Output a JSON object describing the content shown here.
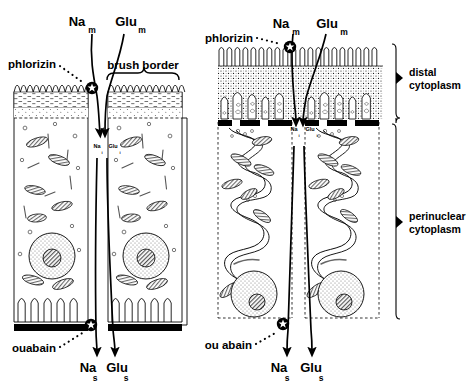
{
  "figure": {
    "background_color": "#ffffff",
    "ink_color": "#000000"
  },
  "panels": {
    "left": {
      "name": "schematic-diagram-panel",
      "apical_labels": {
        "sodium": "Na",
        "sodium_sub": "m",
        "glucose": "Glu",
        "glucose_sub": "m"
      },
      "inhibitor_apical": "phlorizin",
      "brush_border_label": "brush border",
      "intracellular_labels": {
        "sodium": "Na",
        "sodium_sub": "i",
        "glucose": "Glu",
        "glucose_sub": "i"
      },
      "inhibitor_basal": "ouabain",
      "basal_labels": {
        "sodium": "Na",
        "sodium_sub": "s",
        "glucose": "Glu",
        "glucose_sub": "s"
      }
    },
    "right": {
      "name": "realistic-morphology-panel",
      "apical_labels": {
        "sodium": "Na",
        "sodium_sub": "m",
        "glucose": "Glu",
        "glucose_sub": "m"
      },
      "inhibitor_apical": "phlorizin",
      "intracellular_labels": {
        "sodium": "Na",
        "sodium_sub": "i",
        "glucose": "Glu",
        "glucose_sub": "i"
      },
      "inhibitor_basal": "ou abain",
      "basal_labels": {
        "sodium": "Na",
        "sodium_sub": "s",
        "glucose": "Glu",
        "glucose_sub": "s"
      }
    }
  },
  "region_brackets": [
    {
      "id": "distal",
      "line1": "distal",
      "line2": "cytoplasm"
    },
    {
      "id": "perinuclear",
      "line1": "perinuclear",
      "line2": "cytoplasm"
    }
  ],
  "symbols": {
    "inhibition_marker": "starburst-inhibition-icon",
    "transport_arrow": "transport-arrow-icon",
    "bracket": "curly-brace-icon"
  }
}
